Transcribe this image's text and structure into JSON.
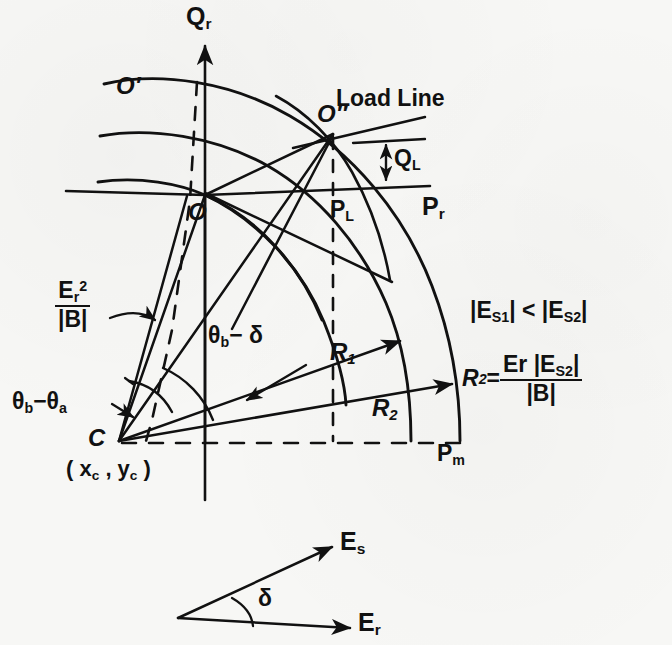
{
  "figure": {
    "type": "engineering-phasor-circle-diagram",
    "background_color": "#f7f7f5",
    "ink_color": "#111111"
  },
  "axes": {
    "q_axis_label": "Q",
    "q_axis_sub": "r",
    "p_axis_label": "P",
    "p_axis_sub": "r"
  },
  "points": {
    "origin": "O",
    "o_prime": "O′",
    "o_double_prime": "O″",
    "center": "C",
    "center_coords": "( x",
    "center_coords_sub1": "c",
    "center_coords_mid": " , y",
    "center_coords_sub2": "c",
    "center_coords_end": " )",
    "p_l": "P",
    "p_l_sub": "L",
    "p_m": "P",
    "p_m_sub": "m",
    "q_l": "Q",
    "q_l_sub": "L"
  },
  "lines": {
    "load_line": "Load Line"
  },
  "radii": {
    "r1": "R",
    "r1_sub": "1",
    "r2": "R",
    "r2_sub": "2"
  },
  "angles": {
    "theta_b_minus_theta_a_1": "θ",
    "theta_b_minus_theta_a_sub1": "b",
    "theta_b_minus_theta_a_2": "−θ",
    "theta_b_minus_theta_a_sub2": "a",
    "theta_b_minus_delta_1": "θ",
    "theta_b_minus_delta_sub": "b",
    "theta_b_minus_delta_2": "− δ",
    "delta": "δ"
  },
  "equations": {
    "er_sq_over_b_num": "E",
    "er_sq_over_b_num_sub": "r",
    "er_sq_over_b_num_sup": "2",
    "er_sq_over_b_den": "|B|",
    "inequality_a": "|E",
    "inequality_a_sub": "S1",
    "inequality_mid": "| < |E",
    "inequality_b_sub": "S2",
    "inequality_end": "|",
    "r2_eq_lhs": "R",
    "r2_eq_lhs_sub": "2",
    "r2_eq_equals": " = ",
    "r2_eq_num_a": "Er |E",
    "r2_eq_num_sub": "S2",
    "r2_eq_num_end": "|",
    "r2_eq_den": "|B|"
  },
  "phasors": {
    "es": "E",
    "es_sub": "s",
    "er": "E",
    "er_sub": "r",
    "delta": "δ"
  }
}
